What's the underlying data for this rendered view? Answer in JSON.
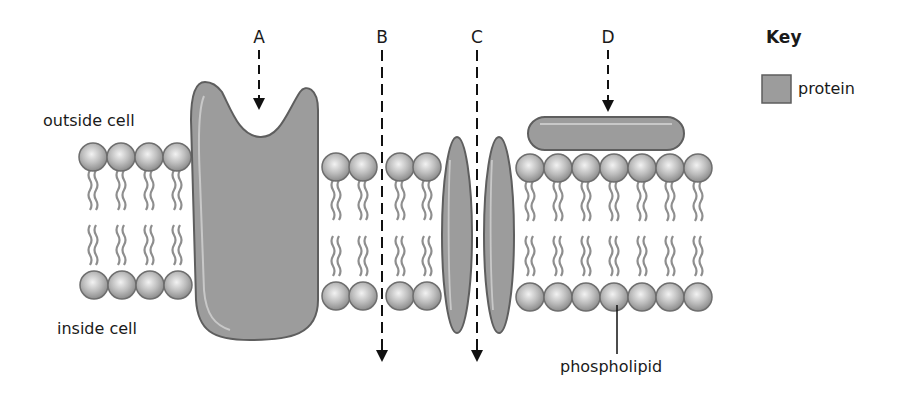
{
  "labels": {
    "outside": "outside cell",
    "inside": "inside cell",
    "phospholipid": "phospholipid",
    "a": "A",
    "b": "B",
    "c": "C",
    "d": "D"
  },
  "key": {
    "title": "Key",
    "items": [
      {
        "label": "protein",
        "color": "#9a9a9a"
      }
    ]
  },
  "colors": {
    "protein_fill": "#9b9b9b",
    "protein_stroke": "#5a5a5a",
    "head_fill": "#bdbdbd",
    "tail": "#8a8a8a"
  }
}
